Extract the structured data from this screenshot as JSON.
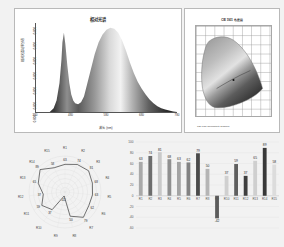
{
  "spectrum": {
    "title": "相对光谱",
    "xlabel": "波长 (nm)",
    "ylabel": "相对光谱功率分布",
    "xticks": [
      "380",
      "480",
      "580",
      "680",
      "780"
    ],
    "yticks": [
      "0.000",
      "0.000",
      "0.000",
      "0.000",
      "0.000",
      "0.000",
      "0.000"
    ]
  },
  "cie": {
    "title": "CIE 1931 色度图",
    "xlabel": "CIE 1931 Chromaticity Diagram"
  },
  "radar": {
    "labels": [
      "R1",
      "R2",
      "R3",
      "R4",
      "R5",
      "R6",
      "R7",
      "R8",
      "R9",
      "R10",
      "R11",
      "R12",
      "R13",
      "R14",
      "R15"
    ],
    "values": [
      63,
      74,
      81,
      68,
      63,
      62,
      79,
      50,
      -42,
      37,
      59,
      37,
      65,
      89,
      58
    ],
    "value_labels": [
      "63",
      "74",
      "81",
      "68",
      "63",
      "62",
      "79",
      "50",
      "-42",
      "37",
      "59",
      "37",
      "65",
      "89",
      "58"
    ]
  },
  "chart_data": {
    "type": "bar",
    "title": "",
    "xlabel": "",
    "ylabel": "",
    "categories": [
      "R1",
      "R2",
      "R3",
      "R4",
      "R5",
      "R6",
      "R7",
      "R8",
      "R9",
      "R10",
      "R11",
      "R12",
      "R13",
      "R14",
      "R15"
    ],
    "values": [
      63,
      74,
      81,
      68,
      63,
      62,
      79,
      50,
      -42,
      37,
      59,
      37,
      65,
      89,
      58
    ],
    "yticks": [
      "100",
      "80",
      "60",
      "40",
      "20",
      "0",
      "-20",
      "-40",
      "-60"
    ],
    "ylim": [
      -60,
      100
    ],
    "grid": true,
    "legend": "none"
  },
  "colors": {
    "panel_bg": "#f2f2f2",
    "plot_bg": "#ffffff",
    "axis": "#555555",
    "bar_light": "#b0b0b0",
    "bar_dark": "#4a4a4a",
    "grid": "#d6d6d6",
    "text": "#333333"
  }
}
